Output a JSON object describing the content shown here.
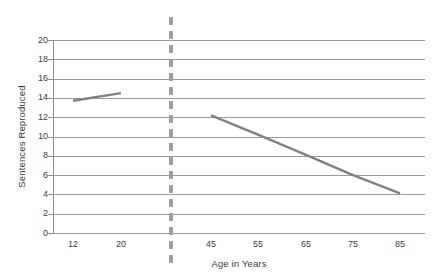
{
  "chart_data": {
    "type": "line",
    "title": "",
    "xlabel": "Age in Years",
    "ylabel": "Sentences Reproduced",
    "ylim": [
      0,
      20
    ],
    "ytick_step": 2,
    "yticks": [
      20,
      18,
      16,
      14,
      12,
      10,
      8,
      6,
      4,
      2,
      0
    ],
    "xticks": [
      "12",
      "20",
      "45",
      "55",
      "65",
      "75",
      "85"
    ],
    "grid": "horizontal",
    "legend": "none",
    "annotations": [
      {
        "name": "group-divider",
        "style": "vertical-dashed-line",
        "description": "dashed vertical divider separating the younger age group (12, 20) from the older age group (45-85)"
      }
    ],
    "series": [
      {
        "name": "Younger group",
        "x": [
          "12",
          "20"
        ],
        "values": [
          13.7,
          14.5
        ],
        "color": "#808080"
      },
      {
        "name": "Older group",
        "x": [
          "45",
          "55",
          "65",
          "75",
          "85"
        ],
        "values": [
          12.2,
          10.2,
          8.1,
          6.0,
          4.1
        ],
        "color": "#808080"
      }
    ]
  },
  "axes": {
    "y_title": "Sentences Reproduced",
    "x_title": "Age in Years",
    "y_labels": [
      "20",
      "18",
      "16",
      "14",
      "12",
      "10",
      "8",
      "6",
      "4",
      "2",
      "0"
    ],
    "x_labels": [
      "12",
      "20",
      "45",
      "55",
      "65",
      "75",
      "85"
    ]
  },
  "colors": {
    "series_line": "#808080",
    "gridline": "#9a9a9a",
    "axis": "#8d8d8d",
    "divider": "#9e9e9e",
    "text": "#3b3b3b",
    "background": "#ffffff"
  }
}
